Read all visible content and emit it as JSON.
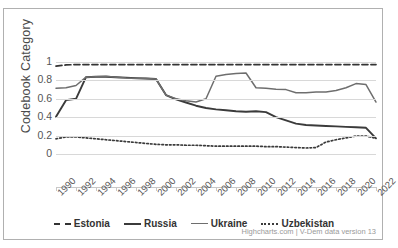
{
  "chart_data": {
    "type": "line",
    "title": "",
    "xlabel": "",
    "ylabel": "Codebook Category",
    "ylim": [
      0,
      1
    ],
    "yticks": [
      0,
      0.2,
      0.4,
      0.6,
      0.8,
      1
    ],
    "ytick_labels": [
      "0",
      "0.2",
      "0.4",
      "0.6",
      "0.8",
      "1"
    ],
    "grid": true,
    "legend_position": "bottom",
    "x": [
      1990,
      1991,
      1992,
      1993,
      1994,
      1995,
      1996,
      1997,
      1998,
      1999,
      2000,
      2001,
      2002,
      2003,
      2004,
      2005,
      2006,
      2007,
      2008,
      2009,
      2010,
      2011,
      2012,
      2013,
      2014,
      2015,
      2016,
      2017,
      2018,
      2019,
      2020,
      2021,
      2022
    ],
    "xtick_labels": [
      "1990",
      "1992",
      "1994",
      "1996",
      "1998",
      "2000",
      "2002",
      "2004",
      "2006",
      "2008",
      "2010",
      "2012",
      "2014",
      "2016",
      "2018",
      "2020",
      "2022"
    ],
    "series": [
      {
        "name": "Estonia",
        "style": "dashed",
        "color": "#333333",
        "values": [
          0.955,
          0.968,
          0.972,
          0.972,
          0.972,
          0.972,
          0.972,
          0.972,
          0.972,
          0.972,
          0.972,
          0.972,
          0.972,
          0.972,
          0.972,
          0.972,
          0.972,
          0.972,
          0.972,
          0.972,
          0.972,
          0.972,
          0.972,
          0.972,
          0.972,
          0.972,
          0.972,
          0.972,
          0.972,
          0.972,
          0.972,
          0.972,
          0.972
        ]
      },
      {
        "name": "Russia",
        "style": "solid-thick",
        "color": "#3b3b3b",
        "values": [
          0.405,
          0.585,
          0.6,
          0.835,
          0.84,
          0.84,
          0.835,
          0.83,
          0.825,
          0.82,
          0.815,
          0.64,
          0.595,
          0.56,
          0.525,
          0.5,
          0.485,
          0.475,
          0.465,
          0.46,
          0.465,
          0.455,
          0.4,
          0.365,
          0.33,
          0.315,
          0.31,
          0.305,
          0.3,
          0.295,
          0.29,
          0.285,
          0.17
        ]
      },
      {
        "name": "Ukraine",
        "style": "solid-thin",
        "color": "#6e6e6e",
        "values": [
          0.715,
          0.72,
          0.745,
          0.835,
          0.84,
          0.845,
          0.835,
          0.825,
          0.82,
          0.82,
          0.815,
          0.64,
          0.6,
          0.58,
          0.565,
          0.6,
          0.845,
          0.865,
          0.875,
          0.88,
          0.72,
          0.715,
          0.705,
          0.7,
          0.665,
          0.665,
          0.675,
          0.675,
          0.69,
          0.72,
          0.765,
          0.755,
          0.565
        ]
      },
      {
        "name": "Uzbekistan",
        "style": "dotted",
        "color": "#3b3b3b",
        "values": [
          0.165,
          0.185,
          0.185,
          0.175,
          0.165,
          0.155,
          0.145,
          0.135,
          0.125,
          0.115,
          0.105,
          0.1,
          0.1,
          0.095,
          0.095,
          0.09,
          0.085,
          0.085,
          0.085,
          0.085,
          0.085,
          0.08,
          0.08,
          0.075,
          0.07,
          0.065,
          0.07,
          0.13,
          0.155,
          0.175,
          0.195,
          0.195,
          0.17
        ]
      }
    ]
  },
  "credits": "Highcharts.com | V-Dem data version 13"
}
